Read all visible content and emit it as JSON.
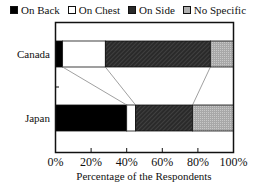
{
  "chart_data": {
    "type": "bar",
    "orientation": "horizontal",
    "stacked": true,
    "categories": [
      "Canada",
      "Japan"
    ],
    "series": [
      {
        "name": "On Back",
        "values": [
          4,
          40
        ],
        "color": "#000000"
      },
      {
        "name": "On Chest",
        "values": [
          24,
          5
        ],
        "color": "#ffffff"
      },
      {
        "name": "On Side",
        "values": [
          59,
          32
        ],
        "color": "#2a2a2a"
      },
      {
        "name": "No Specific",
        "values": [
          13,
          23
        ],
        "color": "#b0b0b0"
      }
    ],
    "title": "",
    "xlabel": "Percentage of the Respondents",
    "ylabel": "",
    "xlim": [
      0,
      100
    ],
    "xticks": [
      "0%",
      "20%",
      "40%",
      "60%",
      "80%",
      "100%"
    ],
    "legend_position": "top",
    "grid": false,
    "connector_lines": true
  },
  "legend": [
    {
      "label": "On Back",
      "color": "#000000"
    },
    {
      "label": "On Chest",
      "color": "#ffffff"
    },
    {
      "label": "On Side",
      "color": "#2a2a2a"
    },
    {
      "label": "No Specific",
      "color": "#b0b0b0"
    }
  ]
}
